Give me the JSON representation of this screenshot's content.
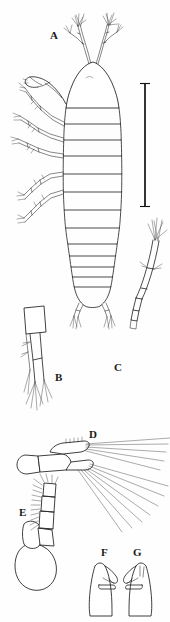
{
  "figure": {
    "type": "scientific-line-drawing",
    "background_color": "#ffffff",
    "ink_color": "#1d1d1d",
    "width_px": 170,
    "height_px": 622
  },
  "panels": [
    {
      "id": "A",
      "label": "A",
      "x": 50,
      "y": 36,
      "description": "whole animal, dorsal habitus with antennae, pereopods and segmented pleon"
    },
    {
      "id": "B",
      "label": "B",
      "x": 58,
      "y": 378,
      "description": "uropod / terminal appendage with apical setae"
    },
    {
      "id": "C",
      "label": "C",
      "x": 117,
      "y": 368,
      "description": "slender curved multi-segmented antenna with apical setae"
    },
    {
      "id": "D",
      "label": "D",
      "x": 93,
      "y": 435,
      "description": "maxilliped or pleopod bearing long plumose setae"
    },
    {
      "id": "E",
      "label": "E",
      "x": 23,
      "y": 513,
      "description": "gnathopod with setose carpus and expanded basis"
    },
    {
      "id": "F",
      "label": "F",
      "x": 105,
      "y": 553,
      "description": "mandible or small appendage, lateral view"
    },
    {
      "id": "G",
      "label": "G",
      "x": 137,
      "y": 553,
      "description": "mandible or small appendage, opposite lateral view"
    }
  ],
  "scale_bar": {
    "present": true,
    "orientation": "vertical",
    "x": 145,
    "y_top": 83,
    "y_bottom": 207,
    "caption": ""
  }
}
